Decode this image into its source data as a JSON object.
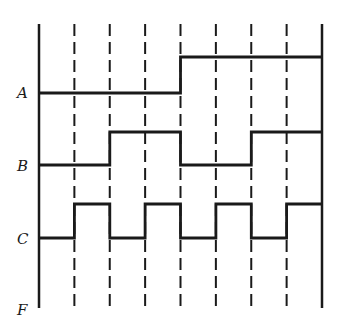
{
  "diagram": {
    "type": "timing-diagram",
    "line_color": "#1a1a1a",
    "grid": {
      "x_start": 39,
      "x_end": 322,
      "y_top": 24,
      "y_bottom": 308,
      "intervals": 8
    },
    "signals": [
      {
        "label": "A",
        "label_y": 93,
        "low_y": 93,
        "high_y": 57,
        "values": [
          0,
          0,
          0,
          0,
          1,
          1,
          1,
          1
        ]
      },
      {
        "label": "B",
        "label_y": 166,
        "low_y": 165,
        "high_y": 132,
        "values": [
          0,
          0,
          1,
          1,
          0,
          0,
          1,
          1
        ]
      },
      {
        "label": "C",
        "label_y": 239,
        "low_y": 238,
        "high_y": 204,
        "values": [
          0,
          1,
          0,
          1,
          0,
          1,
          0,
          1
        ]
      },
      {
        "label": "F",
        "label_y": 310,
        "low_y": null,
        "high_y": null,
        "values": []
      }
    ]
  }
}
